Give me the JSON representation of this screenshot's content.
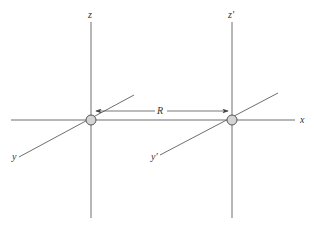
{
  "diagram": {
    "labels": {
      "z_left": "z",
      "z_right": "z′",
      "x": "x",
      "y_left": "y",
      "y_right": "y′",
      "distance": "R"
    },
    "colors": {
      "line": "#6e6e6e",
      "sphere_fill": "#d4d4d4",
      "sphere_stroke": "#555555",
      "text": "#333333"
    }
  }
}
